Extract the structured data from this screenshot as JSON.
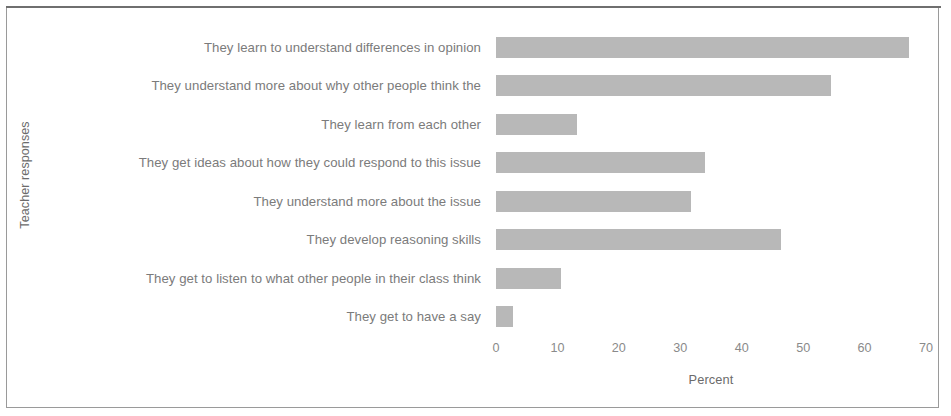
{
  "chart_data": {
    "type": "bar",
    "orientation": "horizontal",
    "title": "",
    "xlabel": "Percent",
    "ylabel": "Teacher responses",
    "xlim": [
      0,
      70
    ],
    "xticks": [
      "0",
      "10",
      "20",
      "30",
      "40",
      "50",
      "60",
      "70"
    ],
    "grid": false,
    "legend": false,
    "bar_color": "#b5b5b5",
    "categories": [
      "They learn to understand differences in opinion",
      "They understand more about why other people think the",
      "They learn from each other",
      "They get ideas about how they could respond to this issue",
      "They understand more about the issue",
      "They develop reasoning skills",
      "They get to listen to what other people in their class think",
      "They get to have a say"
    ],
    "values": [
      67.3,
      54.5,
      13.2,
      34.0,
      31.8,
      46.4,
      10.6,
      2.8
    ]
  }
}
